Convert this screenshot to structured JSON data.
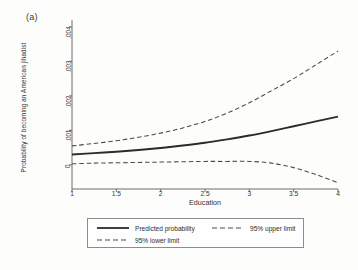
{
  "figure": {
    "panel_label": "(a)",
    "background_color": "#fdfdfb",
    "line_color": "#2b2b2b"
  },
  "chart_data": {
    "type": "line",
    "title": "",
    "subtitle": "",
    "xlabel": "Education",
    "ylabel": "Probability of becoming an American jihadist",
    "xlim": [
      1,
      4
    ],
    "ylim": [
      -0.0007,
      0.0042
    ],
    "xticks": [
      1,
      1.5,
      2,
      2.5,
      3,
      3.5,
      4
    ],
    "xtick_labels": [
      "1",
      "1.5",
      "2",
      "2.5",
      "3",
      "3.5",
      "4"
    ],
    "yticks": [
      0,
      0.001,
      0.002,
      0.003,
      0.004
    ],
    "ytick_labels": [
      "0",
      ".001",
      ".002",
      ".003",
      ".004"
    ],
    "grid": false,
    "legend_position": "below-axis",
    "x": [
      1,
      1.25,
      1.5,
      1.75,
      2,
      2.25,
      2.5,
      2.75,
      3,
      3.25,
      3.5,
      3.75,
      4
    ],
    "series": [
      {
        "name": "Predicted probability",
        "style": "solid",
        "color": "#2b2b2b",
        "values": [
          0.0003,
          0.00034,
          0.00038,
          0.00043,
          0.00049,
          0.00056,
          0.00064,
          0.00074,
          0.00085,
          0.00098,
          0.00112,
          0.00126,
          0.0014
        ]
      },
      {
        "name": "95% upper limit",
        "style": "dashed",
        "color": "#4a4a4a",
        "values": [
          0.00055,
          0.00062,
          0.0007,
          0.0008,
          0.00092,
          0.00107,
          0.00126,
          0.0015,
          0.0018,
          0.00215,
          0.0025,
          0.0029,
          0.0033
        ]
      },
      {
        "name": "95% lower limit",
        "style": "dashed",
        "color": "#4a4a4a",
        "values": [
          3e-05,
          5e-05,
          6e-05,
          7e-05,
          8e-05,
          9e-05,
          0.0001,
          0.0001,
          0.0001,
          5e-05,
          -8e-05,
          -0.00028,
          -0.00052
        ]
      }
    ]
  },
  "legend": {
    "items": [
      {
        "label": "Predicted probability",
        "style": "solid"
      },
      {
        "label": "95% upper limit",
        "style": "dashed"
      },
      {
        "label": "95% lower limit",
        "style": "dashed"
      }
    ]
  }
}
